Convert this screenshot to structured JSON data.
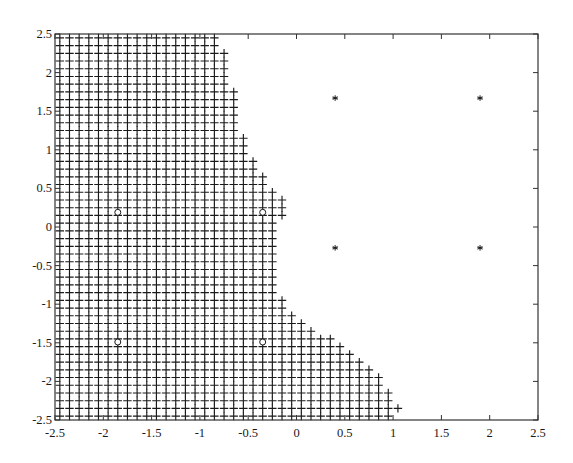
{
  "chart_data": {
    "type": "scatter",
    "title": "",
    "xlabel": "",
    "ylabel": "",
    "xlim": [
      -2.5,
      2.5
    ],
    "ylim": [
      -2.5,
      2.5
    ],
    "grid": false,
    "legend": null,
    "xticks": [
      "-2.5",
      "-2",
      "-1.5",
      "-1",
      "-0.5",
      "0",
      "0.5",
      "1",
      "1.5",
      "2",
      "2.5"
    ],
    "yticks": [
      "2.5",
      "2",
      "1.5",
      "1",
      "0.5",
      "0",
      "-0.5",
      "-1",
      "-1.5",
      "-2",
      "-2.5"
    ],
    "series": [
      {
        "name": "region-plus",
        "marker": "+",
        "description": "grid of points spaced 0.1 (x from -2.45, y from -2.45) filling the left region; each column lists x and its occupied y-ranges",
        "step": 0.1,
        "columns": [
          {
            "x": -2.45,
            "ranges": [
              [
                -2.45,
                2.45
              ]
            ]
          },
          {
            "x": -2.35,
            "ranges": [
              [
                -2.45,
                2.45
              ]
            ]
          },
          {
            "x": -2.25,
            "ranges": [
              [
                -2.45,
                2.45
              ]
            ]
          },
          {
            "x": -2.15,
            "ranges": [
              [
                -2.45,
                2.45
              ]
            ]
          },
          {
            "x": -2.05,
            "ranges": [
              [
                -2.45,
                2.45
              ]
            ]
          },
          {
            "x": -1.95,
            "ranges": [
              [
                -2.45,
                2.45
              ]
            ]
          },
          {
            "x": -1.85,
            "ranges": [
              [
                -2.45,
                2.45
              ]
            ]
          },
          {
            "x": -1.75,
            "ranges": [
              [
                -2.45,
                2.45
              ]
            ]
          },
          {
            "x": -1.65,
            "ranges": [
              [
                -2.45,
                2.45
              ]
            ]
          },
          {
            "x": -1.55,
            "ranges": [
              [
                -2.45,
                2.45
              ]
            ]
          },
          {
            "x": -1.45,
            "ranges": [
              [
                -2.45,
                2.45
              ]
            ]
          },
          {
            "x": -1.35,
            "ranges": [
              [
                -2.45,
                2.45
              ]
            ]
          },
          {
            "x": -1.25,
            "ranges": [
              [
                -2.45,
                2.45
              ]
            ]
          },
          {
            "x": -1.15,
            "ranges": [
              [
                -2.45,
                2.45
              ]
            ]
          },
          {
            "x": -1.05,
            "ranges": [
              [
                -2.45,
                2.45
              ]
            ]
          },
          {
            "x": -0.95,
            "ranges": [
              [
                -2.45,
                2.45
              ]
            ]
          },
          {
            "x": -0.85,
            "ranges": [
              [
                -2.45,
                2.45
              ]
            ]
          },
          {
            "x": -0.75,
            "ranges": [
              [
                -2.45,
                2.25
              ]
            ]
          },
          {
            "x": -0.65,
            "ranges": [
              [
                -2.45,
                1.75
              ]
            ]
          },
          {
            "x": -0.55,
            "ranges": [
              [
                -2.45,
                1.15
              ]
            ]
          },
          {
            "x": -0.45,
            "ranges": [
              [
                -2.45,
                0.85
              ]
            ]
          },
          {
            "x": -0.35,
            "ranges": [
              [
                -2.45,
                0.65
              ]
            ]
          },
          {
            "x": -0.25,
            "ranges": [
              [
                -2.45,
                0.45
              ]
            ]
          },
          {
            "x": -0.15,
            "ranges": [
              [
                0.15,
                0.35
              ],
              [
                -2.45,
                -0.95
              ]
            ]
          },
          {
            "x": -0.05,
            "ranges": [
              [
                -2.45,
                -1.15
              ]
            ]
          },
          {
            "x": 0.05,
            "ranges": [
              [
                -2.45,
                -1.25
              ]
            ]
          },
          {
            "x": 0.15,
            "ranges": [
              [
                -2.45,
                -1.35
              ]
            ]
          },
          {
            "x": 0.25,
            "ranges": [
              [
                -2.45,
                -1.45
              ]
            ]
          },
          {
            "x": 0.35,
            "ranges": [
              [
                -2.45,
                -1.45
              ]
            ]
          },
          {
            "x": 0.45,
            "ranges": [
              [
                -2.45,
                -1.55
              ]
            ]
          },
          {
            "x": 0.55,
            "ranges": [
              [
                -2.45,
                -1.65
              ]
            ]
          },
          {
            "x": 0.65,
            "ranges": [
              [
                -2.45,
                -1.75
              ]
            ]
          },
          {
            "x": 0.75,
            "ranges": [
              [
                -2.45,
                -1.85
              ]
            ]
          },
          {
            "x": 0.85,
            "ranges": [
              [
                -2.45,
                -1.95
              ]
            ]
          },
          {
            "x": 0.95,
            "ranges": [
              [
                -2.45,
                -2.15
              ]
            ]
          },
          {
            "x": 1.05,
            "ranges": [
              [
                -2.35,
                -2.35
              ]
            ]
          }
        ]
      },
      {
        "name": "class-star",
        "marker": "*",
        "points": [
          [
            0.4,
            1.67
          ],
          [
            1.9,
            1.67
          ],
          [
            0.4,
            -0.27
          ],
          [
            1.9,
            -0.27
          ]
        ]
      },
      {
        "name": "class-circle",
        "marker": "o",
        "points": [
          [
            -1.85,
            0.19
          ],
          [
            -0.35,
            0.19
          ],
          [
            -1.85,
            -1.49
          ],
          [
            -0.35,
            -1.49
          ]
        ]
      }
    ]
  },
  "plot": {
    "frame_color": "#333333",
    "marker_color": "#1a1a1a",
    "background": "#ffffff"
  }
}
